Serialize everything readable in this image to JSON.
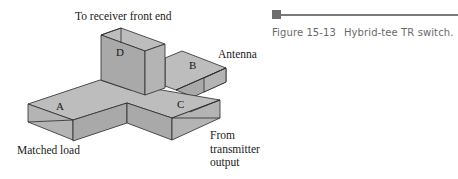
{
  "figure": {
    "number": "Figure 15-13",
    "title": "Hybrid-tee TR switch.",
    "accent_color": "#6e6e6e",
    "rule_color": "#7a7a7a"
  },
  "diagram": {
    "type": "waveguide hybrid tee (magic tee) in TR switch configuration",
    "ports": [
      {
        "id": "A",
        "label": "A",
        "connection": "Matched load"
      },
      {
        "id": "B",
        "label": "B",
        "connection": "Antenna"
      },
      {
        "id": "C",
        "label": "C",
        "connection": "From transmitter output"
      },
      {
        "id": "D",
        "label": "D",
        "connection": "To receiver front end"
      }
    ],
    "labels": {
      "receiver": "To receiver front end",
      "antenna": "Antenna",
      "matched_load": "Matched load",
      "transmitter_line1": "From",
      "transmitter_line2": "transmitter",
      "transmitter_line3": "output"
    }
  }
}
